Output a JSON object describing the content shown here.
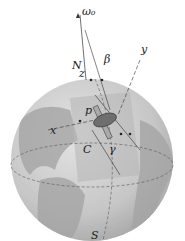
{
  "diagram": {
    "labels": {
      "omega": "ω₀",
      "N": "N",
      "beta": "β",
      "y": "y",
      "z": "z",
      "p": "p",
      "x": "x",
      "C": "C",
      "gamma": "γ",
      "S": "S"
    },
    "colors": {
      "ocean": "#c9c9c9",
      "land": "#9a9a9a",
      "plane": "#b5b5b5",
      "disk": "#6e6e6e"
    }
  }
}
